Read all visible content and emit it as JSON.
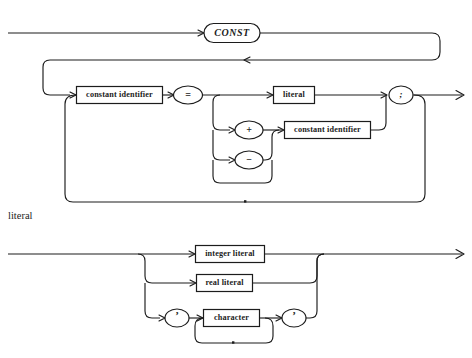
{
  "page": {
    "background_color": "#ffffff",
    "line_color": "#1c1c1c"
  },
  "diagrams": [
    {
      "name": "const-declaration",
      "section_label": "",
      "nodes": {
        "keyword_const": "CONST",
        "constant_identifier_1": "constant identifier",
        "equals": "=",
        "literal": "literal",
        "plus": "+",
        "minus": "−",
        "constant_identifier_2": "constant identifier",
        "semicolon": ";"
      }
    },
    {
      "name": "literal",
      "section_label": "literal",
      "nodes": {
        "integer_literal": "integer literal",
        "real_literal": "real literal",
        "open_quote": "’",
        "character": "character",
        "close_quote": "’"
      }
    }
  ],
  "icons": {
    "arrow_right": "arrow-right-icon",
    "arrow_left": "arrow-left-icon"
  }
}
